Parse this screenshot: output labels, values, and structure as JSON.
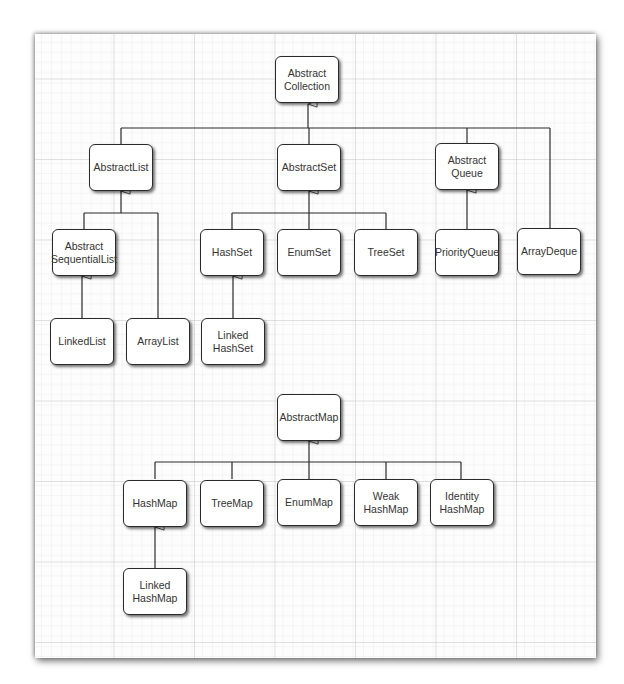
{
  "diagram": {
    "edge_style": "inheritance (hollow triangle arrowhead)",
    "nodes": {
      "abstract_collection": "Abstract\nCollection",
      "abstract_list": "AbstractList",
      "abstract_set": "AbstractSet",
      "abstract_queue": "Abstract\nQueue",
      "array_deque": "ArrayDeque",
      "abstract_sequential_list": "Abstract\nSequentialList",
      "hash_set": "HashSet",
      "enum_set": "EnumSet",
      "tree_set": "TreeSet",
      "priority_queue": "PriorityQueue",
      "linked_list": "LinkedList",
      "array_list": "ArrayList",
      "linked_hash_set": "Linked\nHashSet",
      "abstract_map": "AbstractMap",
      "hash_map": "HashMap",
      "tree_map": "TreeMap",
      "enum_map": "EnumMap",
      "weak_hash_map": "Weak\nHashMap",
      "identity_hash_map": "Identity\nHashMap",
      "linked_hash_map": "Linked\nHashMap"
    },
    "edges": [
      {
        "from": "AbstractList",
        "to": "AbstractCollection"
      },
      {
        "from": "AbstractSet",
        "to": "AbstractCollection"
      },
      {
        "from": "AbstractQueue",
        "to": "AbstractCollection"
      },
      {
        "from": "ArrayDeque",
        "to": "AbstractCollection"
      },
      {
        "from": "AbstractSequentialList",
        "to": "AbstractList"
      },
      {
        "from": "ArrayList",
        "to": "AbstractList"
      },
      {
        "from": "LinkedList",
        "to": "AbstractSequentialList"
      },
      {
        "from": "HashSet",
        "to": "AbstractSet"
      },
      {
        "from": "EnumSet",
        "to": "AbstractSet"
      },
      {
        "from": "TreeSet",
        "to": "AbstractSet"
      },
      {
        "from": "LinkedHashSet",
        "to": "HashSet"
      },
      {
        "from": "PriorityQueue",
        "to": "AbstractQueue"
      },
      {
        "from": "HashMap",
        "to": "AbstractMap"
      },
      {
        "from": "TreeMap",
        "to": "AbstractMap"
      },
      {
        "from": "EnumMap",
        "to": "AbstractMap"
      },
      {
        "from": "WeakHashMap",
        "to": "AbstractMap"
      },
      {
        "from": "IdentityHashMap",
        "to": "AbstractMap"
      },
      {
        "from": "LinkedHashMap",
        "to": "HashMap"
      }
    ],
    "colors": {
      "grid_major": "#c4c4c4",
      "grid_minor": "#e6e6e6",
      "line": "#2a2a2a",
      "box_fill": "#ffffff",
      "text": "#333333"
    }
  }
}
